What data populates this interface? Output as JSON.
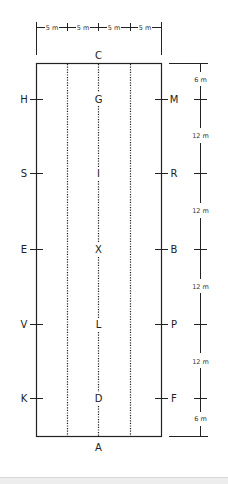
{
  "diagram": {
    "type": "dressage-arena",
    "colors": {
      "line": "#222222",
      "text": "#222222",
      "footer": "#ededed"
    },
    "top_dimensions": [
      "5 m",
      "5 m",
      "5 m",
      "5 m"
    ],
    "end_letters": {
      "top": "C",
      "bottom": "A"
    },
    "left_letters": [
      "H",
      "S",
      "E",
      "V",
      "K"
    ],
    "right_letters": [
      "M",
      "R",
      "B",
      "P",
      "F"
    ],
    "centre_letters": [
      "G",
      "I",
      "X",
      "L",
      "D"
    ],
    "right_scale": [
      "6 m",
      "12 m",
      "12 m",
      "12 m",
      "12 m",
      "6 m"
    ]
  }
}
